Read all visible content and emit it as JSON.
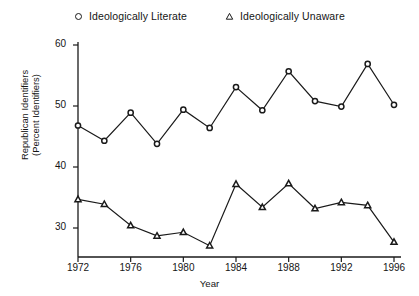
{
  "chart_data": {
    "type": "line",
    "title": "",
    "xlabel": "Year",
    "ylabel": "Republican Identifiers\n(Percent Identifiers)",
    "ylabel_line1": "Republican Identifiers",
    "ylabel_line2": "(Percent Identifiers)",
    "x": [
      1972,
      1974,
      1976,
      1978,
      1980,
      1982,
      1984,
      1986,
      1988,
      1990,
      1992,
      1994,
      1996
    ],
    "xlim": [
      1971,
      1997
    ],
    "ylim": [
      26,
      62
    ],
    "xticks": [
      1972,
      1976,
      1980,
      1984,
      1988,
      1992,
      1996
    ],
    "xtick_labels": [
      "1972",
      "1976",
      "1980",
      "1984",
      "1988",
      "1992",
      "1996"
    ],
    "yticks": [
      30,
      40,
      50,
      60
    ],
    "ytick_labels": [
      "30",
      "40",
      "50",
      "60"
    ],
    "grid": false,
    "legend_position": "top",
    "series": [
      {
        "name": "Ideologically Literate",
        "marker": "circle-open",
        "color": "#1a1a1a",
        "values": [
          46.8,
          44.3,
          48.9,
          43.8,
          49.4,
          46.4,
          53.1,
          49.3,
          55.7,
          50.8,
          49.9,
          56.9,
          50.2
        ]
      },
      {
        "name": "Ideologically Unaware",
        "marker": "triangle-open",
        "color": "#1a1a1a",
        "values": [
          34.7,
          33.9,
          30.4,
          28.7,
          29.3,
          27.1,
          37.2,
          33.4,
          37.3,
          33.2,
          34.2,
          33.7,
          27.7
        ]
      }
    ]
  },
  "legend": [
    {
      "label": "Ideologically Literate",
      "marker": "circle-open"
    },
    {
      "label": "Ideologically Unaware",
      "marker": "triangle-open"
    }
  ],
  "colors": {
    "background": "#ffffff",
    "axis": "#1a1a1a",
    "series": "#1a1a1a"
  }
}
